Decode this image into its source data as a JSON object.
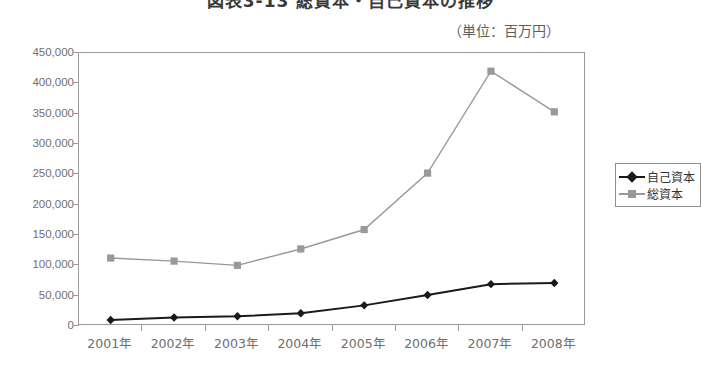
{
  "title": "図表3-13 総資本・自己資本の推移",
  "unit_caption": "（単位：百万円）",
  "legend": {
    "position": "right",
    "items": [
      {
        "label": "自己資本",
        "color": "#1a1a1a",
        "marker": "diamond"
      },
      {
        "label": "総資本",
        "color": "#999999",
        "marker": "square"
      }
    ]
  },
  "chart_data": {
    "type": "line",
    "title": "図表3-13 総資本・自己資本の推移",
    "xlabel": "",
    "ylabel": "",
    "unit": "百万円",
    "categories": [
      "2001年",
      "2002年",
      "2003年",
      "2004年",
      "2005年",
      "2006年",
      "2007年",
      "2008年"
    ],
    "ylim": [
      0,
      450000
    ],
    "ytick_step": 50000,
    "ytick_labels": [
      "0",
      "50,000",
      "100,000",
      "150,000",
      "200,000",
      "250,000",
      "300,000",
      "350,000",
      "400,000",
      "450,000"
    ],
    "ytick_values": [
      0,
      50000,
      100000,
      150000,
      200000,
      250000,
      300000,
      350000,
      400000,
      450000
    ],
    "grid": false,
    "legend_position": "right",
    "series": [
      {
        "name": "自己資本",
        "color": "#1a1a1a",
        "marker": "diamond",
        "values": [
          10000,
          14000,
          16000,
          21000,
          34000,
          51000,
          69000,
          71000
        ]
      },
      {
        "name": "総資本",
        "color": "#999999",
        "marker": "square",
        "values": [
          112000,
          107000,
          100000,
          127000,
          159000,
          252000,
          420000,
          353000
        ]
      }
    ]
  }
}
